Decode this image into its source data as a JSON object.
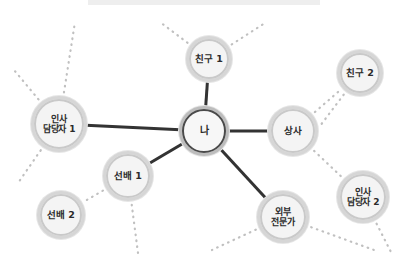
{
  "diagram": {
    "title_bar": "",
    "type": "ego-network",
    "colors": {
      "background": "#ffffff",
      "node_fill": "#f0f0f0",
      "node_ring_outer": "#d6d6d6",
      "node_ring_inner": "#c9c9c9",
      "center_ring": "#4a4a4a",
      "solid_edge": "#333333",
      "dotted_edge": "#c0c0c0",
      "label_text": "#2b2b2b",
      "top_bar": "#eeeeee"
    },
    "nodes": [
      {
        "id": "me",
        "label": "나",
        "x": 204,
        "y": 131,
        "r": 25,
        "size": "s3",
        "center": true
      },
      {
        "id": "friend1",
        "label": "친구 1",
        "x": 209,
        "y": 59,
        "r": 23,
        "size": "s1",
        "center": false
      },
      {
        "id": "hr1",
        "label": "인사\n담당자 1",
        "x": 59,
        "y": 124,
        "r": 28,
        "size": "s2",
        "center": false
      },
      {
        "id": "boss",
        "label": "상사",
        "x": 293,
        "y": 131,
        "r": 25,
        "size": "s1",
        "center": false
      },
      {
        "id": "friend2",
        "label": "친구 2",
        "x": 360,
        "y": 73,
        "r": 23,
        "size": "s1",
        "center": false
      },
      {
        "id": "hr2",
        "label": "인사\n담당자 2",
        "x": 363,
        "y": 197,
        "r": 26,
        "size": "s2",
        "center": false
      },
      {
        "id": "expert",
        "label": "외부\n전문가",
        "x": 283,
        "y": 217,
        "r": 26,
        "size": "s2",
        "center": false
      },
      {
        "id": "senior1",
        "label": "선배 1",
        "x": 128,
        "y": 176,
        "r": 25,
        "size": "s1",
        "center": false
      },
      {
        "id": "senior2",
        "label": "선배 2",
        "x": 61,
        "y": 215,
        "r": 24,
        "size": "s1",
        "center": false
      }
    ],
    "solid_edges": [
      {
        "from": "me",
        "to": "friend1"
      },
      {
        "from": "me",
        "to": "hr1"
      },
      {
        "from": "me",
        "to": "boss"
      },
      {
        "from": "me",
        "to": "senior1"
      },
      {
        "from": "me",
        "to": "expert"
      }
    ],
    "dotted_edges": [
      {
        "from": "boss",
        "to": "friend2"
      },
      {
        "from": "boss",
        "to": "hr2"
      },
      {
        "from": "senior1",
        "to": "senior2"
      }
    ],
    "dotted_stubs": [
      {
        "from": "friend1",
        "x2": 160,
        "y2": 22
      },
      {
        "from": "friend1",
        "x2": 265,
        "y2": 23
      },
      {
        "from": "hr1",
        "x2": 14,
        "y2": 70
      },
      {
        "from": "hr1",
        "x2": 75,
        "y2": 22
      },
      {
        "from": "hr1",
        "x2": 18,
        "y2": 183
      },
      {
        "from": "friend2",
        "x2": 320,
        "y2": 126
      },
      {
        "from": "hr2",
        "x2": 392,
        "y2": 254
      },
      {
        "from": "expert",
        "x2": 212,
        "y2": 250
      },
      {
        "from": "expert",
        "x2": 374,
        "y2": 250
      },
      {
        "from": "senior1",
        "x2": 138,
        "y2": 253
      }
    ]
  }
}
